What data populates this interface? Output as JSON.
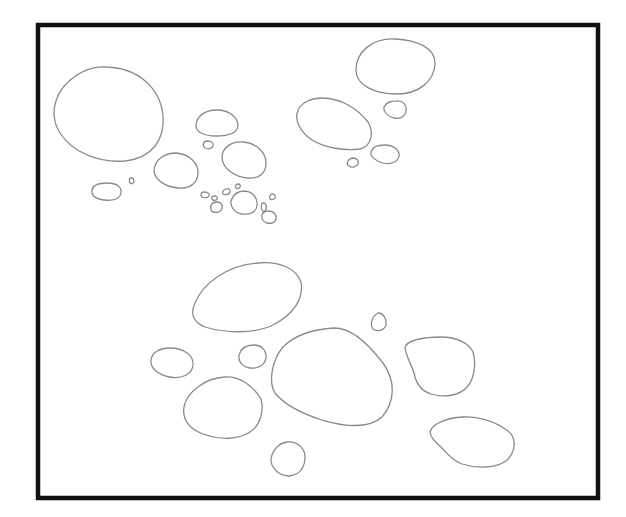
{
  "diagram": {
    "title": "",
    "background": "#ffffff",
    "frame": {
      "x": 38,
      "y": 25,
      "width": 560,
      "height": 473,
      "stroke": "#111111"
    },
    "blob_stroke": "#8a8a8a",
    "groups": [
      {
        "name": "upper-left-cluster",
        "blob_count": 19
      },
      {
        "name": "upper-right-cluster",
        "blob_count": 5
      },
      {
        "name": "lower-cluster",
        "blob_count": 10
      }
    ]
  }
}
